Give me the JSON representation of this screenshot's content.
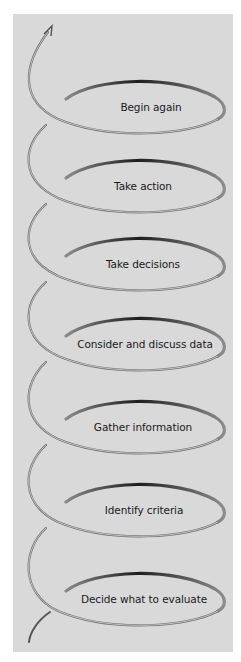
{
  "diagram": {
    "type": "spiral-cycle",
    "background": "#d9d9d9",
    "ribbon_color": "#6a6a6a",
    "steps": [
      {
        "label": "Begin again",
        "x": 151,
        "y": 107
      },
      {
        "label": "Take action",
        "x": 143,
        "y": 186
      },
      {
        "label": "Take decisions",
        "x": 143,
        "y": 264
      },
      {
        "label": "Consider and discuss data",
        "x": 145,
        "y": 344
      },
      {
        "label": "Gather information",
        "x": 143,
        "y": 427
      },
      {
        "label": "Identify criteria",
        "x": 144,
        "y": 510
      },
      {
        "label": "Decide what to evaluate",
        "x": 144,
        "y": 599
      }
    ]
  }
}
